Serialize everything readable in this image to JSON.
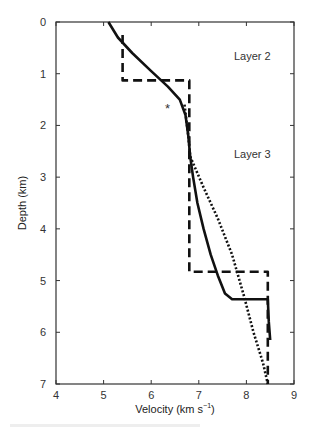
{
  "chart_data": {
    "type": "line",
    "title": "",
    "xlabel": "Velocity (km s⁻¹)",
    "ylabel": "Depth (km)",
    "xlim": [
      4,
      9
    ],
    "ylim": [
      7,
      0
    ],
    "y_inverted": true,
    "x_ticks": [
      4,
      5,
      6,
      7,
      8,
      9
    ],
    "y_ticks": [
      0,
      1,
      2,
      3,
      4,
      5,
      6,
      7
    ],
    "grid": false,
    "legend": null,
    "annotations": [
      {
        "text": "Layer 2",
        "x": 8.0,
        "y": 0.75
      },
      {
        "text": "Layer 3",
        "x": 8.0,
        "y": 2.65
      },
      {
        "text": "*",
        "x": 6.4,
        "y": 1.65
      }
    ],
    "series": [
      {
        "name": "solid-profile",
        "style": "solid",
        "points": [
          [
            5.1,
            0.0
          ],
          [
            5.3,
            0.3
          ],
          [
            5.6,
            0.6
          ],
          [
            6.0,
            0.95
          ],
          [
            6.35,
            1.25
          ],
          [
            6.6,
            1.5
          ],
          [
            6.72,
            1.8
          ],
          [
            6.78,
            2.2
          ],
          [
            6.82,
            2.6
          ],
          [
            6.88,
            3.0
          ],
          [
            6.97,
            3.5
          ],
          [
            7.1,
            4.0
          ],
          [
            7.25,
            4.5
          ],
          [
            7.4,
            4.9
          ],
          [
            7.55,
            5.25
          ],
          [
            7.7,
            5.36
          ],
          [
            8.45,
            5.36
          ],
          [
            8.47,
            5.8
          ],
          [
            8.5,
            6.15
          ]
        ]
      },
      {
        "name": "dotted-profile",
        "style": "dotted",
        "points": [
          [
            6.7,
            1.6
          ],
          [
            6.78,
            2.2
          ],
          [
            6.82,
            2.6
          ],
          [
            7.1,
            3.2
          ],
          [
            7.4,
            3.8
          ],
          [
            7.7,
            4.5
          ],
          [
            7.95,
            5.3
          ],
          [
            8.15,
            6.0
          ],
          [
            8.35,
            6.6
          ],
          [
            8.45,
            7.0
          ]
        ]
      },
      {
        "name": "dashed-layered-model",
        "style": "dashed",
        "points": [
          [
            5.4,
            0.25
          ],
          [
            5.4,
            1.13
          ],
          [
            6.8,
            1.13
          ],
          [
            6.8,
            4.83
          ],
          [
            8.45,
            4.83
          ],
          [
            8.45,
            7.0
          ]
        ]
      }
    ]
  },
  "labels": {
    "xlabel_main": "Velocity (km s",
    "xlabel_sup": "−1",
    "xlabel_close": ")",
    "ylabel": "Depth (km)",
    "layer2": "Layer 2",
    "layer3": "Layer 3",
    "asterisk": "*"
  }
}
